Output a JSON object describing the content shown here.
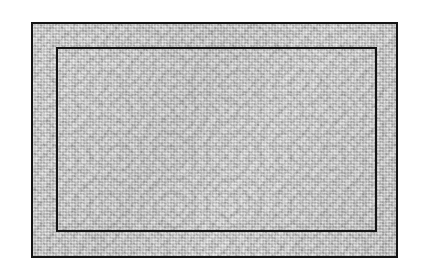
{
  "page": {
    "width": 423,
    "height": 275,
    "background_color": "#ffffff",
    "medium": "halftone print scan"
  },
  "figure": {
    "name": "framed-rectangular-panel",
    "label": "",
    "fill_texture": "mottled-gray-halftone",
    "texture_base_color": "#c9c9c9",
    "rule_color": "#141414"
  },
  "geometry": {
    "outer_frame": {
      "x": 31,
      "y": 22,
      "width": 367,
      "height": 236,
      "stroke_width": 2,
      "stroke_color": "#141414"
    },
    "inner_frame": {
      "x": 56,
      "y": 47,
      "width": 321,
      "height": 185,
      "stroke_width": 2,
      "stroke_color": "#141414"
    },
    "border_band": {
      "top": 25,
      "right": 21,
      "bottom": 26,
      "left": 25
    },
    "center_panel": {
      "x": 58,
      "y": 49,
      "width": 317,
      "height": 181
    },
    "page_margin": {
      "left": 31,
      "top": 22,
      "right": 25,
      "bottom": 17
    }
  },
  "regions": {
    "corner_top_left": "corner-cell",
    "corner_top_right": "corner-cell",
    "corner_bottom_left": "corner-cell",
    "corner_bottom_right": "corner-cell",
    "band_top": "border-band-top",
    "band_right": "border-band-right",
    "band_bottom": "border-band-bottom",
    "band_left": "border-band-left",
    "field": "center-field"
  },
  "colors": {
    "rule": "#141414",
    "texture_light": "#d8d8d8",
    "texture_mid": "#c4c4c4",
    "texture_dark": "#a6a6a6",
    "paper_white": "#ffffff"
  }
}
